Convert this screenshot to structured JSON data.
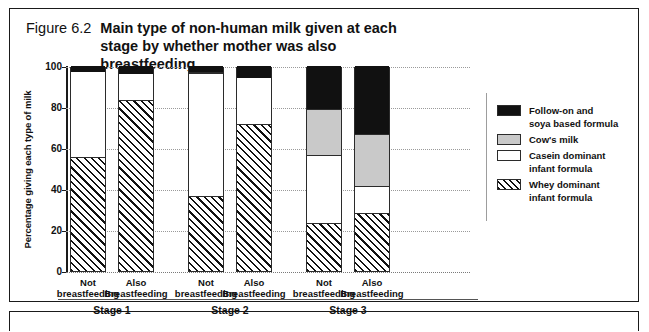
{
  "figure": {
    "number_label": "Figure 6.2",
    "title": "Main type of non-human milk given at each stage by whether mother was also breastfeeding"
  },
  "chart_data": {
    "type": "bar",
    "subtype": "stacked-percentage",
    "title": "Main type of non-human milk given at each stage by whether mother was also breastfeeding",
    "xlabel": "",
    "ylabel": "Percentage giving each type of milk",
    "ylim": [
      0,
      100
    ],
    "yticks": [
      "0",
      "20",
      "40",
      "60",
      "80",
      "100"
    ],
    "grid": true,
    "legend_position": "right",
    "group_labels": [
      "Stage 1",
      "Stage 2",
      "Stage 3"
    ],
    "categories": [
      "Not breastfeeding",
      "Also Breastfeeding",
      "Not breastfeeding",
      "Also Breastfeeding",
      "Not breastfeeding",
      "Also Breastfeeding"
    ],
    "category_lines": [
      [
        "Not",
        "breastfeeding"
      ],
      [
        "Also",
        "Breastfeeding"
      ],
      [
        "Not",
        "breastfeeding"
      ],
      [
        "Also",
        "Breastfeeding"
      ],
      [
        "Not",
        "breastfeeding"
      ],
      [
        "Also",
        "Breastfeeding"
      ]
    ],
    "series": [
      {
        "name": "Whey dominant infant formula",
        "fill": "diagonal-hatch",
        "values": [
          55,
          83,
          36,
          71,
          23,
          28
        ]
      },
      {
        "name": "Casein dominant infant formula",
        "fill": "white",
        "values": [
          42,
          13,
          60,
          23,
          33,
          13
        ]
      },
      {
        "name": "Cow's milk",
        "fill": "gray",
        "values": [
          0,
          0,
          1,
          0,
          23,
          26
        ]
      },
      {
        "name": "Follow-on and soya based formula",
        "fill": "black",
        "values": [
          3,
          4,
          3,
          6,
          21,
          33
        ]
      }
    ]
  },
  "legend": {
    "items": [
      {
        "label_lines": [
          "Follow-on and",
          "soya based formula"
        ],
        "swatch": "black"
      },
      {
        "label_lines": [
          "Cow's milk"
        ],
        "swatch": "gray"
      },
      {
        "label_lines": [
          "Casein dominant",
          "infant formula"
        ],
        "swatch": "white"
      },
      {
        "label_lines": [
          "Whey dominant",
          "infant formula"
        ],
        "swatch": "whey"
      }
    ]
  },
  "colors": {
    "black_segment": "#111111",
    "gray_segment": "#c9c9c9",
    "white_segment": "#ffffff",
    "hatch_ink": "#111111",
    "frame": "#1a1a1a",
    "gridline": "#9a9a9a"
  }
}
